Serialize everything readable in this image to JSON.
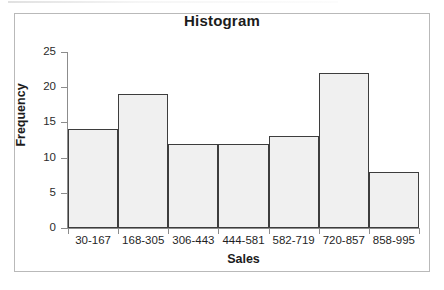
{
  "chart_data": {
    "type": "bar",
    "title": "Histogram",
    "xlabel": "Sales",
    "ylabel": "Frequency",
    "categories": [
      "30-167",
      "168-305",
      "306-443",
      "444-581",
      "582-719",
      "720-857",
      "858-995"
    ],
    "values": [
      14,
      19,
      12,
      12,
      13,
      22,
      8
    ],
    "ylim": [
      0,
      25
    ],
    "yticks": [
      0,
      5,
      10,
      15,
      20,
      25
    ],
    "ytick_labels": [
      "0",
      "5",
      "10",
      "15",
      "20",
      "25"
    ],
    "grid": false,
    "legend": false,
    "bar_fill_color": "#f0f0f0",
    "bar_edge_color": "#3d3d3d",
    "axis_color": "#8c8c8c",
    "frame_color": "#b9b9b9",
    "background_color": "#ffffff"
  }
}
